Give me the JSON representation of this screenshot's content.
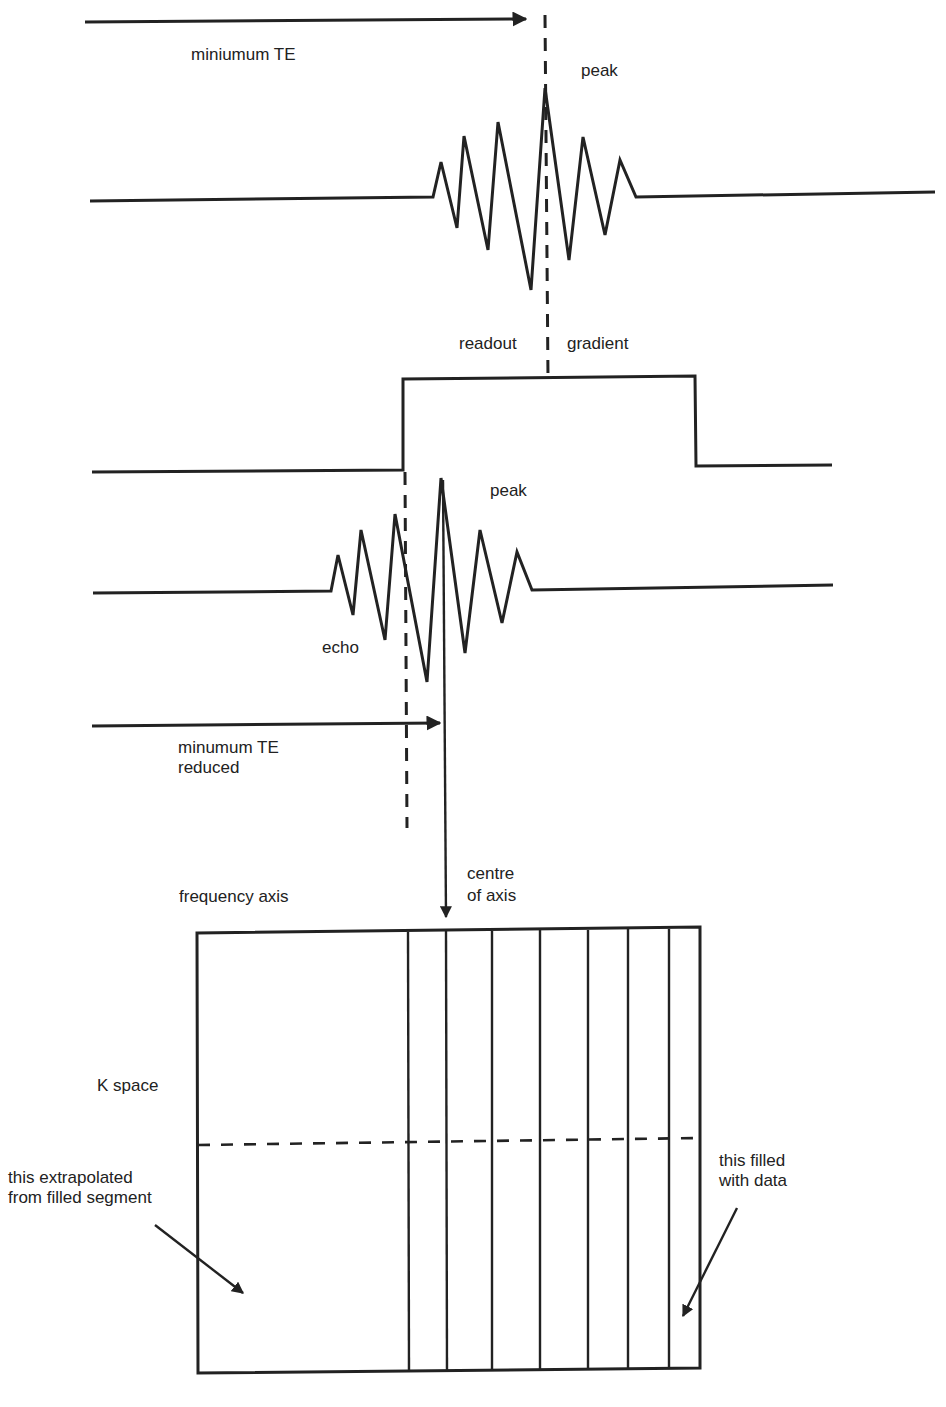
{
  "diagram": {
    "labels": {
      "minimum_te": "miniumum TE",
      "peak_top": "peak",
      "readout": "readout",
      "gradient": "gradient",
      "peak_echo": "peak",
      "echo": "echo",
      "minimum_te_reduced_line1": "minumum TE",
      "minimum_te_reduced_line2": "reduced",
      "centre_line1": "centre",
      "centre_line2": "of axis",
      "frequency_axis": "frequency axis",
      "k_space": "K space",
      "extrapolated_line1": "this extrapolated",
      "extrapolated_line2": "from filled segment",
      "filled_line1": "this filled",
      "filled_line2": "with data"
    },
    "colors": {
      "ink": "#222222",
      "background": "#ffffff"
    },
    "elements": {
      "full_echo_waveform": "symmetric echo signal centred on dashed peak line",
      "readout_gradient": "rectangular gradient pulse",
      "partial_echo_waveform": "echo shifted earlier (reduced TE)",
      "k_space_grid": {
        "unfilled_segment": "left half, extrapolated",
        "filled_columns": 8,
        "centre_line": "dashed horizontal"
      }
    }
  }
}
